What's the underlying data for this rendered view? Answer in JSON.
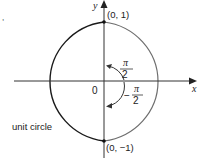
{
  "diagram": {
    "title": "",
    "axes": {
      "x_label": "x",
      "y_label": "y",
      "origin_label": "0"
    },
    "circle": {
      "label": "unit circle",
      "left_half_color": "#1a1a1a",
      "right_half_color": "#6e6e6e"
    },
    "points": {
      "top": "(0, 1)",
      "bottom": "(0, −1)"
    },
    "angles": {
      "upper": {
        "numerator": "π",
        "denominator": "2",
        "sign": ""
      },
      "lower": {
        "numerator": "π",
        "denominator": "2",
        "sign": "−"
      }
    },
    "stray_mark": ","
  }
}
